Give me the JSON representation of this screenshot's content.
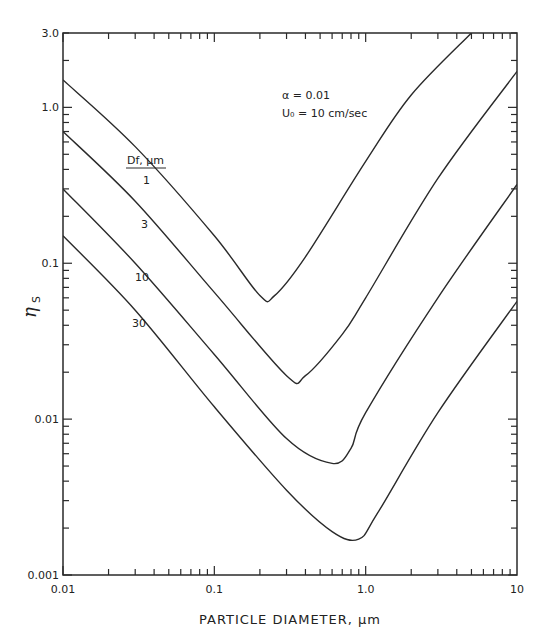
{
  "chart_data": {
    "type": "line",
    "title": "",
    "xlabel": "PARTICLE DIAMETER, µm",
    "ylabel": "η_S",
    "xscale": "log",
    "yscale": "log",
    "xlim": [
      0.01,
      10
    ],
    "ylim": [
      0.001,
      3.0
    ],
    "grid": false,
    "x_tick_labels": [
      "0.01",
      "0.1",
      "1.0",
      "10"
    ],
    "x_ticks": [
      0.01,
      0.1,
      1.0,
      10
    ],
    "y_tick_labels": [
      "0.001",
      "0.01",
      "0.1",
      "1.0",
      "3.0"
    ],
    "y_ticks": [
      0.001,
      0.01,
      0.1,
      1.0,
      3.0
    ],
    "legend_title": "Df, µm",
    "annotations": [
      "α = 0.01",
      "U0 = 10 cm/sec"
    ],
    "series": [
      {
        "name": "1",
        "label_pos": [
          143,
          184
        ],
        "x": [
          0.01,
          0.03,
          0.1,
          0.2,
          0.25,
          0.4,
          1.0,
          2.0,
          5.0
        ],
        "values": [
          1.5,
          0.56,
          0.15,
          0.062,
          0.062,
          0.11,
          0.45,
          1.2,
          3.0
        ]
      },
      {
        "name": "3",
        "label_pos": [
          141,
          228
        ],
        "x": [
          0.01,
          0.03,
          0.1,
          0.3,
          0.4,
          0.7,
          1.0,
          3.0,
          10
        ],
        "values": [
          0.7,
          0.25,
          0.065,
          0.019,
          0.019,
          0.035,
          0.06,
          0.35,
          1.7
        ]
      },
      {
        "name": "10",
        "label_pos": [
          135,
          281
        ],
        "x": [
          0.01,
          0.03,
          0.1,
          0.3,
          0.6,
          0.8,
          1.0,
          3.0,
          10
        ],
        "values": [
          0.3,
          0.1,
          0.026,
          0.0075,
          0.0052,
          0.0065,
          0.011,
          0.06,
          0.32
        ]
      },
      {
        "name": "30",
        "label_pos": [
          132,
          327
        ],
        "x": [
          0.01,
          0.03,
          0.1,
          0.3,
          0.6,
          0.9,
          1.2,
          3.0,
          10
        ],
        "values": [
          0.15,
          0.05,
          0.012,
          0.0035,
          0.0019,
          0.0017,
          0.0025,
          0.011,
          0.057
        ]
      }
    ]
  },
  "labels": {
    "xlabel": "PARTICLE DIAMETER, µm",
    "ylabel_main": "η",
    "ylabel_sub": "S",
    "legend_title": "Df, µm",
    "alpha": "α = 0.01",
    "velocity": "U₀ = 10 cm/sec"
  }
}
